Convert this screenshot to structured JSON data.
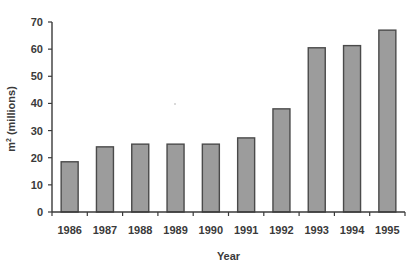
{
  "chart_data": {
    "type": "bar",
    "title": "",
    "xlabel": "Year",
    "ylabel": "m² (millions)",
    "ylabel_base": "m",
    "ylabel_sup": "2",
    "ylabel_rest": " (millions)",
    "categories": [
      "1986",
      "1987",
      "1988",
      "1989",
      "1990",
      "1991",
      "1992",
      "1993",
      "1994",
      "1995"
    ],
    "values": [
      18.5,
      24,
      25,
      25,
      25,
      27.3,
      38,
      60.5,
      61.3,
      67
    ],
    "ylim": [
      0,
      70
    ],
    "yticks": [
      0,
      10,
      20,
      30,
      40,
      50,
      60,
      70
    ],
    "grid": false,
    "legend": null,
    "colors": {
      "bar_fill": "#9c9c9c",
      "bar_stroke": "#4a4a4a",
      "axis": "#3a3a3a"
    }
  }
}
